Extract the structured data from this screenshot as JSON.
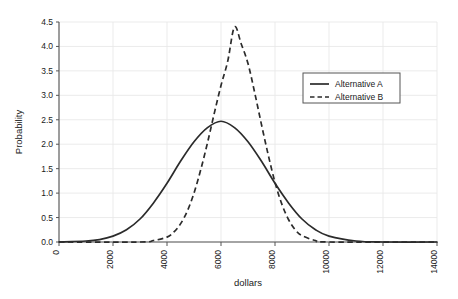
{
  "chart_data": {
    "type": "line",
    "title": "",
    "xlabel": "dollars",
    "ylabel": "Probability",
    "xlim": [
      0,
      14000
    ],
    "ylim": [
      0,
      4.5
    ],
    "xticks": [
      0,
      2000,
      4000,
      6000,
      8000,
      10000,
      12000,
      14000
    ],
    "xtick_labels": [
      "0",
      "2000",
      "4000",
      "6000",
      "8000",
      "10000",
      "12000",
      "14000"
    ],
    "xtick_rotation": 90,
    "yticks": [
      0.0,
      0.5,
      1.0,
      1.5,
      2.0,
      2.5,
      3.0,
      3.5,
      4.0,
      4.5
    ],
    "ytick_labels": [
      "0.0",
      "0.5",
      "1.0",
      "1.5",
      "2.0",
      "2.5",
      "3.0",
      "3.5",
      "4.0",
      "4.5"
    ],
    "y_scale_note": "values shown are probability density x 10^-4",
    "grid": true,
    "grid_color": "#e9e9e9",
    "legend_position": "upper right",
    "series": [
      {
        "name": "Alternative A",
        "style": "solid",
        "color": "#2b2b2b",
        "distribution": "normal",
        "mean": 6000,
        "sigma": 1615,
        "peak_value": 2.47,
        "peak_x": 6000,
        "points": [
          {
            "x": 0,
            "y": 0.0
          },
          {
            "x": 1000,
            "y": 0.02
          },
          {
            "x": 1500,
            "y": 0.05
          },
          {
            "x": 2000,
            "y": 0.12
          },
          {
            "x": 2500,
            "y": 0.25
          },
          {
            "x": 3000,
            "y": 0.47
          },
          {
            "x": 3500,
            "y": 0.8
          },
          {
            "x": 4000,
            "y": 1.2
          },
          {
            "x": 4500,
            "y": 1.65
          },
          {
            "x": 5000,
            "y": 2.05
          },
          {
            "x": 5500,
            "y": 2.34
          },
          {
            "x": 6000,
            "y": 2.47
          },
          {
            "x": 6500,
            "y": 2.34
          },
          {
            "x": 7000,
            "y": 2.05
          },
          {
            "x": 7500,
            "y": 1.65
          },
          {
            "x": 8000,
            "y": 1.2
          },
          {
            "x": 8500,
            "y": 0.8
          },
          {
            "x": 9000,
            "y": 0.47
          },
          {
            "x": 9500,
            "y": 0.25
          },
          {
            "x": 10000,
            "y": 0.12
          },
          {
            "x": 11000,
            "y": 0.02
          },
          {
            "x": 12000,
            "y": 0.0
          },
          {
            "x": 14000,
            "y": 0.0
          }
        ]
      },
      {
        "name": "Alternative B",
        "style": "dashed",
        "color": "#2b2b2b",
        "distribution": "normal",
        "mean": 6500,
        "sigma": 907,
        "peak_value": 4.4,
        "peak_x": 6500,
        "points": [
          {
            "x": 0,
            "y": 0.0
          },
          {
            "x": 3000,
            "y": 0.0
          },
          {
            "x": 3500,
            "y": 0.03
          },
          {
            "x": 4000,
            "y": 0.1
          },
          {
            "x": 4250,
            "y": 0.2
          },
          {
            "x": 4500,
            "y": 0.37
          },
          {
            "x": 4750,
            "y": 0.63
          },
          {
            "x": 5000,
            "y": 1.0
          },
          {
            "x": 5250,
            "y": 1.48
          },
          {
            "x": 5500,
            "y": 2.03
          },
          {
            "x": 5750,
            "y": 2.63
          },
          {
            "x": 6000,
            "y": 3.2
          },
          {
            "x": 6250,
            "y": 3.7
          },
          {
            "x": 6500,
            "y": 4.4
          },
          {
            "x": 6750,
            "y": 4.05
          },
          {
            "x": 7000,
            "y": 3.65
          },
          {
            "x": 7250,
            "y": 3.05
          },
          {
            "x": 7500,
            "y": 2.4
          },
          {
            "x": 7750,
            "y": 1.78
          },
          {
            "x": 8000,
            "y": 1.22
          },
          {
            "x": 8250,
            "y": 0.78
          },
          {
            "x": 8500,
            "y": 0.46
          },
          {
            "x": 8750,
            "y": 0.25
          },
          {
            "x": 9000,
            "y": 0.13
          },
          {
            "x": 9500,
            "y": 0.03
          },
          {
            "x": 10000,
            "y": 0.0
          },
          {
            "x": 14000,
            "y": 0.0
          }
        ]
      }
    ],
    "legend": [
      {
        "label": "Alternative A",
        "style": "solid"
      },
      {
        "label": "Alternative B",
        "style": "dashed"
      }
    ]
  }
}
